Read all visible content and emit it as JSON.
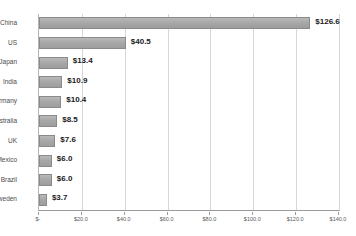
{
  "chart_data": {
    "type": "bar",
    "orientation": "horizontal",
    "title": "",
    "subtitle": "",
    "xlabel": "",
    "ylabel": "",
    "xlim": [
      0,
      140
    ],
    "grid": true,
    "legend": false,
    "categories": [
      "China",
      "US",
      "Japan",
      "India",
      "Germany",
      "Australia",
      "UK",
      "Mexico",
      "Brazil",
      "Sweden"
    ],
    "values": [
      126.6,
      40.5,
      13.4,
      10.9,
      10.4,
      8.5,
      7.6,
      6.0,
      6.0,
      3.7
    ],
    "value_labels": [
      "$126.6",
      "$40.5",
      "$13.4",
      "$10.9",
      "$10.4",
      "$8.5",
      "$7.6",
      "$6.0",
      "$6.0",
      "$3.7"
    ],
    "xticks": [
      0,
      20,
      40,
      60,
      80,
      100,
      120,
      140
    ],
    "xtick_labels": [
      "$-",
      "$20.0",
      "$40.0",
      "$60.0",
      "$80.0",
      "$100.0",
      "$120.0",
      "$140.0"
    ],
    "colors": {
      "bar_fill": "#a8a8a8",
      "bar_border": "#8a8a8a",
      "gridline": "#d6d6d6",
      "axis": "#9a9a9a",
      "value_text": "#1a1a1a",
      "category_text": "#4a4a4a",
      "tick_text": "#5a5a5a",
      "background": "#ffffff"
    }
  }
}
